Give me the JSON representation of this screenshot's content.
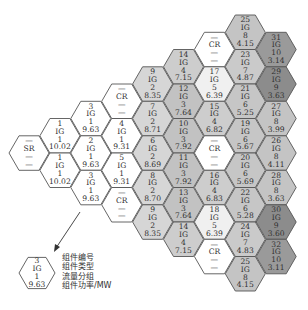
{
  "diagram": {
    "title": "",
    "group_colors": {
      "1": "#ffffff",
      "2": "#d6d6d6",
      "3": "#c2c2c2",
      "4": "#cdcdcd",
      "5": "#f0f0f0",
      "6": "#c6c6c6",
      "7": "#cacaca",
      "8": "#c4c4c4",
      "9": "#8c8c8c",
      "10": "#9a9a9a",
      "none": "#ffffff"
    },
    "stroke_color": "#555555",
    "hexes": [
      {
        "col": 0,
        "k": 0,
        "lines": [
          "—",
          "SR",
          "—",
          "—"
        ],
        "group": "none",
        "kind": "SR"
      },
      {
        "col": 1,
        "k": -1,
        "lines": [
          "1",
          "IG",
          "1",
          "10.02"
        ],
        "group": "1",
        "kind": "IG"
      },
      {
        "col": 1,
        "k": 1,
        "lines": [
          "1",
          "IG",
          "1",
          "10.02"
        ],
        "group": "1",
        "kind": "IG"
      },
      {
        "col": 2,
        "k": -2,
        "lines": [
          "3",
          "IG",
          "1",
          "9.63"
        ],
        "group": "1",
        "kind": "IG"
      },
      {
        "col": 2,
        "k": 0,
        "lines": [
          "2",
          "IG",
          "1",
          "9.63"
        ],
        "group": "1",
        "kind": "IG"
      },
      {
        "col": 2,
        "k": 2,
        "lines": [
          "3",
          "IG",
          "1",
          "9.63"
        ],
        "group": "1",
        "kind": "IG"
      },
      {
        "col": 3,
        "k": -3,
        "lines": [
          "—",
          "CR",
          "—",
          "—"
        ],
        "group": "none",
        "kind": "CR"
      },
      {
        "col": 3,
        "k": -1,
        "lines": [
          "4",
          "IG",
          "1",
          "9.31"
        ],
        "group": "1",
        "kind": "IG"
      },
      {
        "col": 3,
        "k": 1,
        "lines": [
          "5",
          "IG",
          "1",
          "9.31"
        ],
        "group": "1",
        "kind": "IG"
      },
      {
        "col": 3,
        "k": 3,
        "lines": [
          "—",
          "CR",
          "—",
          "—"
        ],
        "group": "none",
        "kind": "CR"
      },
      {
        "col": 4,
        "k": -4,
        "lines": [
          "9",
          "IG",
          "2",
          "8.35"
        ],
        "group": "2",
        "kind": "IG"
      },
      {
        "col": 4,
        "k": -2,
        "lines": [
          "7",
          "IG",
          "2",
          "8.71"
        ],
        "group": "2",
        "kind": "IG"
      },
      {
        "col": 4,
        "k": 0,
        "lines": [
          "6",
          "IG",
          "2",
          "8.69"
        ],
        "group": "2",
        "kind": "IG"
      },
      {
        "col": 4,
        "k": 2,
        "lines": [
          "8",
          "IG",
          "2",
          "8.70"
        ],
        "group": "2",
        "kind": "IG"
      },
      {
        "col": 4,
        "k": 4,
        "lines": [
          "9",
          "IG",
          "2",
          "8.35"
        ],
        "group": "2",
        "kind": "IG"
      },
      {
        "col": 5,
        "k": -5,
        "lines": [
          "14",
          "IG",
          "4",
          "7.15"
        ],
        "group": "4",
        "kind": "IG"
      },
      {
        "col": 5,
        "k": -3,
        "lines": [
          "12",
          "IG",
          "3",
          "7.64"
        ],
        "group": "3",
        "kind": "IG"
      },
      {
        "col": 5,
        "k": -1,
        "lines": [
          "10",
          "IG",
          "3",
          "7.92"
        ],
        "group": "3",
        "kind": "IG"
      },
      {
        "col": 5,
        "k": 1,
        "lines": [
          "11",
          "IG",
          "3",
          "7.92"
        ],
        "group": "3",
        "kind": "IG"
      },
      {
        "col": 5,
        "k": 3,
        "lines": [
          "13",
          "IG",
          "3",
          "7.64"
        ],
        "group": "3",
        "kind": "IG"
      },
      {
        "col": 5,
        "k": 5,
        "lines": [
          "14",
          "IG",
          "4",
          "7.15"
        ],
        "group": "4",
        "kind": "IG"
      },
      {
        "col": 6,
        "k": -6,
        "lines": [
          "—",
          "CR",
          "—",
          "—"
        ],
        "group": "none",
        "kind": "CR"
      },
      {
        "col": 6,
        "k": -4,
        "lines": [
          "17",
          "IG",
          "5",
          "6.39"
        ],
        "group": "5",
        "kind": "IG"
      },
      {
        "col": 6,
        "k": -2,
        "lines": [
          "15",
          "IG",
          "4",
          "6.82"
        ],
        "group": "4",
        "kind": "IG"
      },
      {
        "col": 6,
        "k": 0,
        "lines": [
          "—",
          "CR",
          "—",
          "—"
        ],
        "group": "none",
        "kind": "CR"
      },
      {
        "col": 6,
        "k": 2,
        "lines": [
          "16",
          "IG",
          "4",
          "6.83"
        ],
        "group": "4",
        "kind": "IG"
      },
      {
        "col": 6,
        "k": 4,
        "lines": [
          "18",
          "IG",
          "5",
          "6.39"
        ],
        "group": "5",
        "kind": "IG"
      },
      {
        "col": 6,
        "k": 6,
        "lines": [
          "—",
          "CR",
          "—",
          "—"
        ],
        "group": "none",
        "kind": "CR"
      },
      {
        "col": 7,
        "k": -7,
        "lines": [
          "25",
          "IG",
          "8",
          "4.15"
        ],
        "group": "8",
        "kind": "IG"
      },
      {
        "col": 7,
        "k": -5,
        "lines": [
          "23",
          "IG",
          "7",
          "4.87"
        ],
        "group": "7",
        "kind": "IG"
      },
      {
        "col": 7,
        "k": -3,
        "lines": [
          "21",
          "IG",
          "6",
          "5.25"
        ],
        "group": "6",
        "kind": "IG"
      },
      {
        "col": 7,
        "k": -1,
        "lines": [
          "19",
          "IG",
          "6",
          "5.67"
        ],
        "group": "6",
        "kind": "IG"
      },
      {
        "col": 7,
        "k": 1,
        "lines": [
          "20",
          "IG",
          "6",
          "5.69"
        ],
        "group": "6",
        "kind": "IG"
      },
      {
        "col": 7,
        "k": 3,
        "lines": [
          "22",
          "IG",
          "6",
          "5.28"
        ],
        "group": "6",
        "kind": "IG"
      },
      {
        "col": 7,
        "k": 5,
        "lines": [
          "24",
          "IG",
          "7",
          "4.83"
        ],
        "group": "7",
        "kind": "IG"
      },
      {
        "col": 7,
        "k": 7,
        "lines": [
          "25",
          "IG",
          "8",
          "4.15"
        ],
        "group": "8",
        "kind": "IG"
      },
      {
        "col": 8,
        "k": -6,
        "lines": [
          "31",
          "IG",
          "10",
          "3.14"
        ],
        "group": "10",
        "kind": "IG"
      },
      {
        "col": 8,
        "k": -4,
        "lines": [
          "29",
          "IG",
          "9",
          "3.63"
        ],
        "group": "9",
        "kind": "IG"
      },
      {
        "col": 8,
        "k": -2,
        "lines": [
          "27",
          "IG",
          "8",
          "3.99"
        ],
        "group": "8",
        "kind": "IG"
      },
      {
        "col": 8,
        "k": 0,
        "lines": [
          "26",
          "IG",
          "8",
          "4.11"
        ],
        "group": "8",
        "kind": "IG"
      },
      {
        "col": 8,
        "k": 2,
        "lines": [
          "28",
          "IG",
          "8",
          "3.63"
        ],
        "group": "8",
        "kind": "IG"
      },
      {
        "col": 8,
        "k": 4,
        "lines": [
          "30",
          "IG",
          "9",
          "3.60"
        ],
        "group": "9",
        "kind": "IG"
      },
      {
        "col": 8,
        "k": 6,
        "lines": [
          "32",
          "IG",
          "10",
          "3.11"
        ],
        "group": "10",
        "kind": "IG"
      }
    ],
    "legend": {
      "hex_lines": [
        "3",
        "IG",
        "1",
        "9.63"
      ],
      "labels": [
        "组件编号",
        "组件类型",
        "流量分组",
        "组件功率/MW"
      ]
    }
  }
}
